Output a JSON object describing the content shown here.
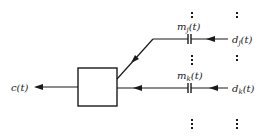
{
  "diagram": {
    "type": "block-diagram",
    "output": {
      "label": "c",
      "arg": "(t)"
    },
    "inputs": [
      {
        "id": "j",
        "modulator_label": "m",
        "modulator_sub": "j",
        "modulator_arg": "(t)",
        "source_label": "d",
        "source_sub": "j",
        "source_arg": "(t)"
      },
      {
        "id": "k",
        "modulator_label": "m",
        "modulator_sub": "k",
        "modulator_arg": "(t)",
        "source_label": "d",
        "source_sub": "k",
        "source_arg": "(t)"
      }
    ],
    "ellipsis": "⋮",
    "colors": {
      "stroke": "#1a1a1a",
      "background": "#ffffff"
    }
  }
}
